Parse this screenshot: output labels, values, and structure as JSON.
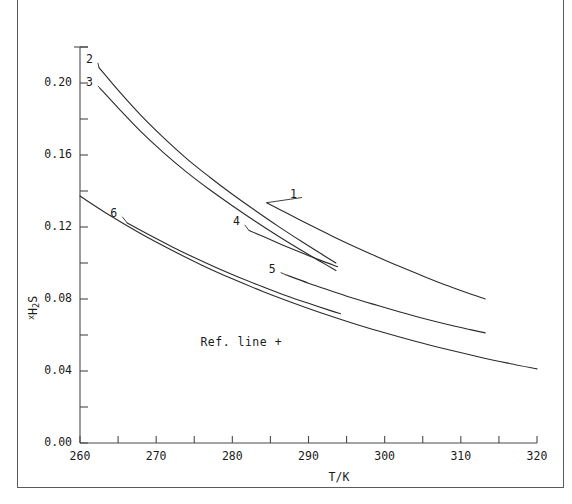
{
  "figure": {
    "background": "#ffffff",
    "line_color": "#2b2b2b",
    "axis_color": "#4a4a4a"
  },
  "chart_data": {
    "type": "line",
    "title": "",
    "xlabel": "T/K",
    "ylabel": "x_H2S",
    "ylabel_parts": {
      "pre": "x",
      "base": "H",
      "sub1": "2",
      "base2": "S"
    },
    "xlim": [
      260,
      320
    ],
    "ylim": [
      0.0,
      0.22
    ],
    "xticks": [
      260,
      265,
      270,
      275,
      280,
      285,
      290,
      295,
      300,
      305,
      310,
      315,
      320
    ],
    "xtick_labels": [
      "260",
      "",
      "270",
      "",
      "280",
      "",
      "290",
      "",
      "300",
      "",
      "310",
      "",
      "320"
    ],
    "yticks": [
      0.0,
      0.02,
      0.04,
      0.06,
      0.08,
      0.1,
      0.12,
      0.14,
      0.16,
      0.18,
      0.2,
      0.22
    ],
    "ytick_labels": [
      "0.00",
      "",
      "0.04",
      "",
      "0.08",
      "",
      "0.12",
      "",
      "0.16",
      "",
      "0.20",
      ""
    ],
    "grid": false,
    "legend_position": "inline-curve-labels",
    "annotations": [
      {
        "text": "Ref. line +",
        "x": 285.0,
        "y": 0.0555,
        "name": "ref-line-annotation"
      }
    ],
    "series": [
      {
        "name": "1",
        "label": "1",
        "label_x": 288.1,
        "label_y": 0.1375,
        "x": [
          284.5,
          287.0,
          290.0,
          293.0,
          296.0,
          299.0,
          302.0,
          305.0,
          308.0,
          311.0,
          313.2
        ],
        "y": [
          0.1335,
          0.128,
          0.1215,
          0.1152,
          0.1092,
          0.1035,
          0.098,
          0.0928,
          0.0878,
          0.0832,
          0.08
        ]
      },
      {
        "name": "2",
        "label": "2",
        "label_x": 261.3,
        "label_y": 0.2123,
        "x": [
          262.5,
          265.0,
          268.0,
          271.0,
          274.0,
          277.0,
          280.0,
          283.0,
          286.0,
          289.0,
          292.0,
          293.6
        ],
        "y": [
          0.2085,
          0.196,
          0.182,
          0.1695,
          0.158,
          0.1478,
          0.1382,
          0.1292,
          0.1205,
          0.1122,
          0.1042,
          0.1
        ]
      },
      {
        "name": "3",
        "label": "3",
        "label_x": 261.3,
        "label_y": 0.1995,
        "x": [
          262.6,
          265.0,
          268.0,
          271.0,
          274.0,
          277.0,
          280.0,
          283.0,
          286.0,
          289.0,
          292.0,
          293.6
        ],
        "y": [
          0.1972,
          0.1862,
          0.173,
          0.1612,
          0.1505,
          0.1408,
          0.1318,
          0.1232,
          0.115,
          0.1072,
          0.0998,
          0.0958
        ]
      },
      {
        "name": "4",
        "label": "4",
        "label_x": 280.6,
        "label_y": 0.1222,
        "x": [
          282.2,
          284.0,
          286.5,
          289.0,
          291.5,
          293.8
        ],
        "y": [
          0.118,
          0.1148,
          0.1102,
          0.1058,
          0.1016,
          0.098
        ]
      },
      {
        "name": "5",
        "label": "5",
        "label_x": 285.3,
        "label_y": 0.0958,
        "x": [
          287.0,
          290.0,
          293.0,
          296.0,
          299.0,
          302.0,
          305.0,
          308.0,
          311.0,
          313.2
        ],
        "y": [
          0.0935,
          0.0888,
          0.0845,
          0.0803,
          0.0765,
          0.0728,
          0.0693,
          0.0661,
          0.0632,
          0.0612
        ]
      },
      {
        "name": "6",
        "label": "6",
        "label_x": 264.5,
        "label_y": 0.1268,
        "x": [
          266.2,
          269.0,
          272.0,
          275.0,
          278.0,
          281.0,
          284.0,
          287.0,
          290.0,
          293.0,
          294.2
        ],
        "y": [
          0.1222,
          0.1158,
          0.1092,
          0.103,
          0.0972,
          0.0918,
          0.0868,
          0.082,
          0.0776,
          0.0734,
          0.0718
        ]
      },
      {
        "name": "ref-line",
        "label": "",
        "label_x": null,
        "label_y": null,
        "x": [
          260.0,
          264.0,
          268.0,
          272.0,
          276.0,
          280.0,
          284.0,
          288.0,
          292.0,
          296.0,
          300.0,
          304.0,
          308.0,
          312.0,
          316.0,
          320.0
        ],
        "y": [
          0.1372,
          0.1262,
          0.1162,
          0.1072,
          0.0988,
          0.0912,
          0.0842,
          0.0778,
          0.0718,
          0.0663,
          0.0612,
          0.0565,
          0.0522,
          0.0482,
          0.0445,
          0.0412
        ]
      }
    ]
  }
}
